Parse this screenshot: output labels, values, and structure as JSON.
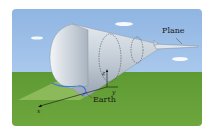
{
  "figure": {
    "labels": {
      "plane": "Plane",
      "earth": "Earth"
    },
    "axes": {
      "x": "x",
      "y": "y",
      "z": "z"
    },
    "colors": {
      "sky": "#9fc0e8",
      "ground": "#66a038",
      "cone": "#c9d2dc",
      "intersection_curve": "#3a7bd5"
    }
  }
}
